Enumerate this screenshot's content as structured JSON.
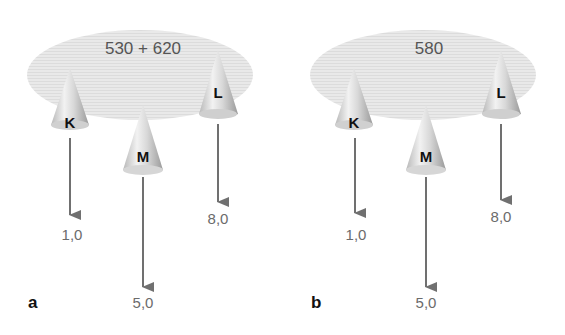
{
  "panels": [
    {
      "label": "a",
      "ellipse_text": "530 + 620",
      "cones": [
        {
          "name": "K",
          "value": "1,0"
        },
        {
          "name": "M",
          "value": "5,0"
        },
        {
          "name": "L",
          "value": "8,0"
        }
      ]
    },
    {
      "label": "b",
      "ellipse_text": "580",
      "cones": [
        {
          "name": "K",
          "value": "1,0"
        },
        {
          "name": "M",
          "value": "5,0"
        },
        {
          "name": "L",
          "value": "8,0"
        }
      ]
    }
  ],
  "colors": {
    "ellipse": "#e6e6e6",
    "arrow": "#707070",
    "value_text": "#6b6b6b"
  }
}
